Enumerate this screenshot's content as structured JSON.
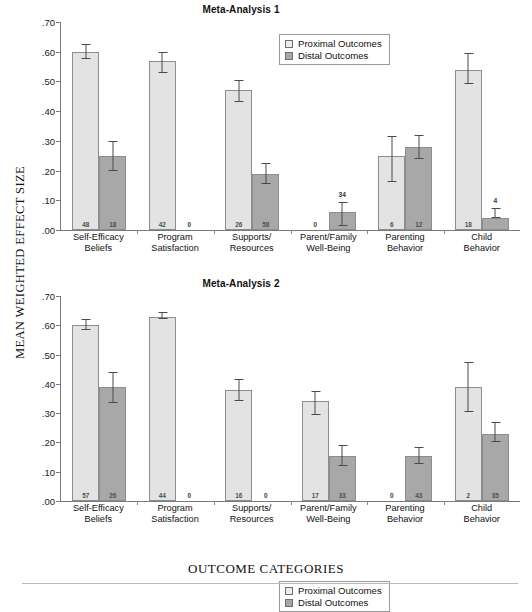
{
  "axis": {
    "y_title": "MEAN WEIGHTED EFFECT SIZE",
    "x_title": "OUTCOME CATEGORIES",
    "y_ticks": [
      ".70",
      ".60",
      ".50",
      ".40",
      ".30",
      ".20",
      ".10",
      ".00"
    ]
  },
  "legend": {
    "proximal_label": "Proximal Outcomes",
    "distal_label": "Distal Outcomes",
    "proximal_color": "#ececec",
    "distal_color": "#a8a8a8"
  },
  "panels": [
    {
      "title": "Meta-Analysis 1"
    },
    {
      "title": "Meta-Analysis 2"
    }
  ],
  "categories": [
    {
      "line1": "Self-Efficacy",
      "line2": "Beliefs"
    },
    {
      "line1": "Program",
      "line2": "Satisfaction"
    },
    {
      "line1": "Supports/",
      "line2": "Resources"
    },
    {
      "line1": "Parent/Family",
      "line2": "Well-Being"
    },
    {
      "line1": "Parenting",
      "line2": "Behavior"
    },
    {
      "line1": "Child",
      "line2": "Behavior"
    }
  ],
  "chart_data": [
    {
      "type": "bar",
      "title": "Meta-Analysis 1",
      "xlabel": "OUTCOME CATEGORIES",
      "ylabel": "MEAN WEIGHTED EFFECT SIZE",
      "ylim": [
        0.0,
        0.7
      ],
      "ytick_values": [
        0.7,
        0.6,
        0.5,
        0.4,
        0.3,
        0.2,
        0.1,
        0.0
      ],
      "grid": false,
      "legend_position": "top-right",
      "categories": [
        "Self-Efficacy Beliefs",
        "Program Satisfaction",
        "Supports/ Resources",
        "Parent/Family Well-Being",
        "Parenting Behavior",
        "Child Behavior"
      ],
      "series": [
        {
          "name": "Proximal Outcomes",
          "values": [
            0.6,
            0.57,
            0.47,
            0.0,
            0.25,
            0.54
          ],
          "err_low": [
            0.025,
            0.04,
            0.04,
            0.0,
            0.09,
            0.05
          ],
          "err_high": [
            0.025,
            0.03,
            0.035,
            0.0,
            0.065,
            0.055
          ],
          "n_counts": [
            "48",
            "42",
            "26",
            "0",
            "6",
            "18"
          ]
        },
        {
          "name": "Distal Outcomes",
          "values": [
            0.25,
            0.0,
            0.19,
            0.06,
            0.28,
            0.04
          ],
          "err_low": [
            0.05,
            0.0,
            0.035,
            0.045,
            0.04,
            0.0
          ],
          "err_high": [
            0.05,
            0.0,
            0.035,
            0.035,
            0.04,
            0.035
          ],
          "n_counts": [
            "18",
            "0",
            "58",
            "34",
            "12",
            "4"
          ]
        }
      ]
    },
    {
      "type": "bar",
      "title": "Meta-Analysis 2",
      "xlabel": "OUTCOME CATEGORIES",
      "ylabel": "MEAN WEIGHTED EFFECT SIZE",
      "ylim": [
        0.0,
        0.7
      ],
      "ytick_values": [
        0.7,
        0.6,
        0.5,
        0.4,
        0.3,
        0.2,
        0.1,
        0.0
      ],
      "grid": false,
      "legend_position": "top-right",
      "categories": [
        "Self-Efficacy Beliefs",
        "Program Satisfaction",
        "Supports/ Resources",
        "Parent/Family Well-Being",
        "Parenting Behavior",
        "Child Behavior"
      ],
      "series": [
        {
          "name": "Proximal Outcomes",
          "values": [
            0.6,
            0.63,
            0.38,
            0.34,
            0.0,
            0.39
          ],
          "err_low": [
            0.015,
            0.01,
            0.04,
            0.045,
            0.0,
            0.085
          ],
          "err_high": [
            0.02,
            0.015,
            0.035,
            0.035,
            0.0,
            0.085
          ],
          "n_counts": [
            "57",
            "44",
            "16",
            "17",
            "0",
            "2"
          ]
        },
        {
          "name": "Distal Outcomes",
          "values": [
            0.39,
            0.0,
            0.0,
            0.155,
            0.155,
            0.23
          ],
          "err_low": [
            0.055,
            0.0,
            0.0,
            0.035,
            0.03,
            0.03
          ],
          "err_high": [
            0.05,
            0.0,
            0.0,
            0.035,
            0.03,
            0.04
          ],
          "n_counts": [
            "26",
            "0",
            "0",
            "33",
            "43",
            "35"
          ]
        }
      ]
    }
  ]
}
